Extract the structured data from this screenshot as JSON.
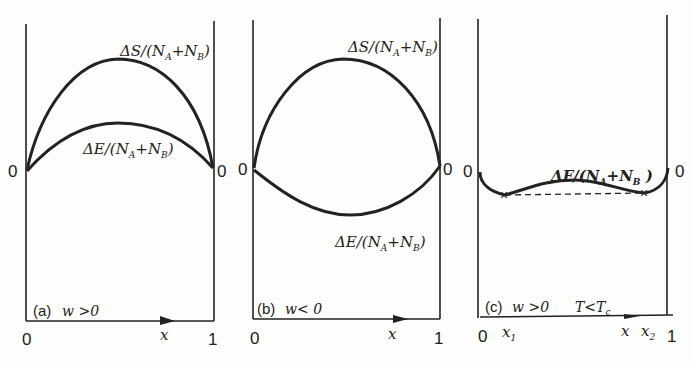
{
  "figure": {
    "panels": [
      {
        "id": "a",
        "caption_tag": "(a)",
        "condition": "w >0",
        "curves": [
          {
            "name": "entropy-of-mixing",
            "label_main": "ΔS/(N",
            "sub1": "A",
            "plus": "+N",
            "sub2": "B",
            "close": ")"
          },
          {
            "name": "energy-of-mixing",
            "label_main": "ΔE/(N",
            "sub1": "A",
            "plus": "+N",
            "sub2": "B",
            "close": ")"
          }
        ],
        "x_axis": {
          "label": "x",
          "start": "0",
          "end": "1"
        },
        "y_origin_left": "0",
        "y_origin_right": "0"
      },
      {
        "id": "b",
        "caption_tag": "(b)",
        "condition": "w< 0",
        "curves": [
          {
            "name": "entropy-of-mixing",
            "label_main": "ΔS/(N",
            "sub1": "A",
            "plus": "+N",
            "sub2": "B",
            "close": ")"
          },
          {
            "name": "energy-of-mixing",
            "label_main": "ΔE/(N",
            "sub1": "A",
            "plus": "+N",
            "sub2": "B",
            "close": ")"
          }
        ],
        "x_axis": {
          "label": "x",
          "start": "0",
          "end": "1"
        },
        "y_origin_left": "0",
        "y_origin_right": "0"
      },
      {
        "id": "c",
        "caption_tag": "(c)",
        "condition": "w >0",
        "temperature_condition": "T<T",
        "temperature_sub": "c",
        "curves": [
          {
            "name": "free-energy-of-mixing",
            "label_main": "ΔF/(N",
            "sub1": "A",
            "plus": "+N",
            "sub2": "B",
            "close": " )"
          }
        ],
        "x_axis": {
          "label": "x",
          "start": "0",
          "end": "1",
          "x1": "x",
          "x1_sub": "1",
          "x2": "x",
          "x2_sub": "2"
        },
        "y_origin_left": "0",
        "y_origin_right": "0",
        "common_tangent": "dashed line between minima x1 and x2"
      }
    ]
  }
}
